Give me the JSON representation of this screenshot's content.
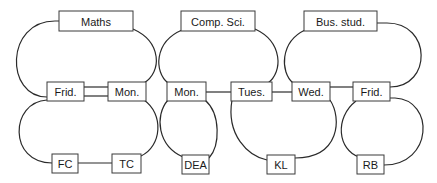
{
  "diagram": {
    "type": "timetable-graph",
    "colors": {
      "line": "#2a2a2a",
      "box_border": "#3a3a3a",
      "text": "#1a1a1a",
      "background": "#ffffff"
    },
    "nodes": {
      "maths": {
        "label": "Maths"
      },
      "comp_sci": {
        "label": "Comp. Sci."
      },
      "bus_stud": {
        "label": "Bus. stud."
      },
      "frid_1": {
        "label": "Frid."
      },
      "mon_1": {
        "label": "Mon."
      },
      "mon_2": {
        "label": "Mon."
      },
      "tues": {
        "label": "Tues."
      },
      "wed": {
        "label": "Wed."
      },
      "frid_2": {
        "label": "Frid."
      },
      "fc": {
        "label": "FC"
      },
      "tc": {
        "label": "TC"
      },
      "dea": {
        "label": "DEA"
      },
      "kl": {
        "label": "KL"
      },
      "rb": {
        "label": "RB"
      }
    },
    "edges": [
      {
        "from": "maths",
        "to": "frid_1"
      },
      {
        "from": "maths",
        "to": "mon_1"
      },
      {
        "from": "frid_1",
        "to": "mon_1",
        "style": "double"
      },
      {
        "from": "frid_1",
        "to": "fc"
      },
      {
        "from": "mon_1",
        "to": "tc"
      },
      {
        "from": "fc",
        "to": "tc"
      },
      {
        "from": "comp_sci",
        "to": "mon_2"
      },
      {
        "from": "comp_sci",
        "to": "tues"
      },
      {
        "from": "mon_2",
        "to": "tues"
      },
      {
        "from": "mon_2",
        "to": "dea"
      },
      {
        "from": "tues",
        "to": "wed"
      },
      {
        "from": "tues",
        "to": "kl"
      },
      {
        "from": "wed",
        "to": "kl"
      },
      {
        "from": "bus_stud",
        "to": "wed"
      },
      {
        "from": "bus_stud",
        "to": "frid_2"
      },
      {
        "from": "wed",
        "to": "frid_2"
      },
      {
        "from": "frid_2",
        "to": "rb"
      }
    ]
  }
}
